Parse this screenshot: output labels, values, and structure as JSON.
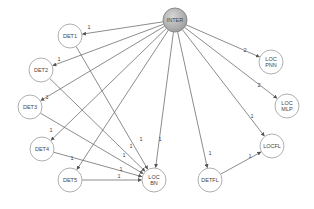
{
  "diagram": {
    "type": "directed-graph",
    "nodes": [
      {
        "id": "INTER",
        "lines": [
          "INTER"
        ],
        "x": 175,
        "y": 20,
        "r": 12,
        "fill": "#b3b3b3"
      },
      {
        "id": "DET1",
        "lines": [
          "DET1"
        ],
        "x": 70,
        "y": 36,
        "r": 12,
        "fill": "#ffffff"
      },
      {
        "id": "DET2",
        "lines": [
          "DET2"
        ],
        "x": 41,
        "y": 70,
        "r": 12,
        "fill": "#ffffff"
      },
      {
        "id": "DET3",
        "lines": [
          "DET3"
        ],
        "x": 30,
        "y": 107,
        "r": 12,
        "fill": "#ffffff"
      },
      {
        "id": "DET4",
        "lines": [
          "DET4"
        ],
        "x": 42,
        "y": 149,
        "r": 12,
        "fill": "#ffffff"
      },
      {
        "id": "DET5",
        "lines": [
          "DET5"
        ],
        "x": 70,
        "y": 180,
        "r": 12,
        "fill": "#ffffff"
      },
      {
        "id": "LOCBN",
        "lines": [
          "LOC",
          "BN"
        ],
        "x": 154,
        "y": 180,
        "r": 12,
        "fill": "#ffffff"
      },
      {
        "id": "DETFL",
        "lines": [
          "DETFL"
        ],
        "x": 210,
        "y": 180,
        "r": 12,
        "fill": "#ffffff"
      },
      {
        "id": "LOCFL",
        "lines": [
          "LOCFL"
        ],
        "x": 272,
        "y": 146,
        "r": 12,
        "fill": "#ffffff"
      },
      {
        "id": "LOCPNN",
        "lines": [
          "LOC",
          "PNN"
        ],
        "x": 271,
        "y": 62,
        "r": 12,
        "fill": "#ffffff"
      },
      {
        "id": "LOCMLP",
        "lines": [
          "LOC",
          "MLP"
        ],
        "x": 287,
        "y": 106,
        "r": 12,
        "fill": "#ffffff"
      }
    ],
    "edges": [
      {
        "from": "INTER",
        "to": "DET1",
        "label": "1",
        "lx": 89,
        "ly": 29
      },
      {
        "from": "INTER",
        "to": "DET2",
        "label": "1",
        "lx": 59,
        "ly": 61
      },
      {
        "from": "INTER",
        "to": "DET3",
        "label": "1",
        "lx": 47,
        "ly": 99
      },
      {
        "from": "INTER",
        "to": "DET4",
        "label": "1",
        "lx": 51,
        "ly": 132
      },
      {
        "from": "INTER",
        "to": "DET5",
        "label": "1",
        "lx": 72,
        "ly": 160
      },
      {
        "from": "INTER",
        "to": "LOCBN",
        "label": "1",
        "lx": 160,
        "ly": 141
      },
      {
        "from": "INTER",
        "to": "DETFL",
        "label": "1",
        "lx": 210,
        "ly": 155
      },
      {
        "from": "INTER",
        "to": "LOCFL",
        "label": "1",
        "lx": 252,
        "ly": 118
      },
      {
        "from": "INTER",
        "to": "LOCPNN",
        "label": "2",
        "lx": 245,
        "ly": 52
      },
      {
        "from": "INTER",
        "to": "LOCMLP",
        "label": "2",
        "lx": 259,
        "ly": 87
      },
      {
        "from": "DET1",
        "to": "LOCBN",
        "label": "1",
        "lx": 141,
        "ly": 141
      },
      {
        "from": "DET2",
        "to": "LOCBN",
        "label": "1",
        "lx": 131,
        "ly": 148
      },
      {
        "from": "DET3",
        "to": "LOCBN",
        "label": "1",
        "lx": 124,
        "ly": 157
      },
      {
        "from": "DET4",
        "to": "LOCBN",
        "label": "1",
        "lx": 121,
        "ly": 171
      },
      {
        "from": "DET5",
        "to": "LOCBN",
        "label": "1",
        "lx": 119,
        "ly": 178
      },
      {
        "from": "DETFL",
        "to": "LOCFL",
        "label": "1",
        "lx": 250,
        "ly": 158
      }
    ],
    "colors": {
      "edge": "#6e6e6e",
      "node_stroke": "#b0b0b0",
      "inter_fill": "#b3b3b3",
      "inter_stroke": "#8a8a8a"
    }
  }
}
